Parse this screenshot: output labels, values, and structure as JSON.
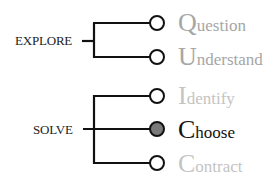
{
  "groups": [
    {
      "label": "EXPLORE",
      "steps": [
        0,
        1
      ]
    },
    {
      "label": "SOLVE",
      "steps": [
        2,
        3,
        4
      ]
    }
  ],
  "steps": [
    {
      "initial": "Q",
      "rest": "uestion",
      "color": "#a6a6a6",
      "node": "open"
    },
    {
      "initial": "U",
      "rest": "nderstand",
      "color": "#a6a6a6",
      "node": "open"
    },
    {
      "initial": "I",
      "rest": "dentify",
      "color": "#c4c4c4",
      "node": "open"
    },
    {
      "initial": "C",
      "rest": "hoose",
      "color": "#111111",
      "node": "filled"
    },
    {
      "initial": "C",
      "rest": "ontract",
      "color": "#c4c4c4",
      "node": "open"
    }
  ],
  "colors": {
    "line": "#111111",
    "filled_node": "#7a7a7a",
    "open_node": "#ffffff"
  }
}
